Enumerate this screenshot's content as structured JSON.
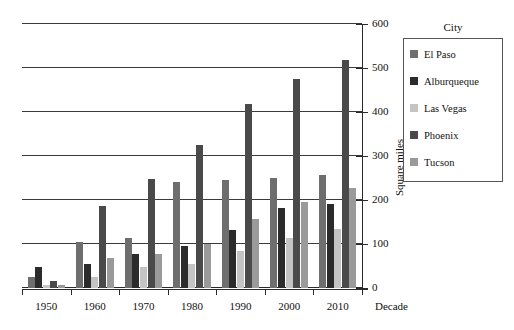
{
  "chart_data": {
    "type": "bar",
    "title": "",
    "xlabel": "Decade",
    "ylabel": "Square miles",
    "categories": [
      "1950",
      "1960",
      "1970",
      "1980",
      "1990",
      "2000",
      "2010"
    ],
    "ylim": [
      0,
      600
    ],
    "yticks": [
      0,
      100,
      200,
      300,
      400,
      500,
      600
    ],
    "grid": true,
    "legend_title": "City",
    "legend_position": "right",
    "series": [
      {
        "name": "El Paso",
        "color": "#6e6e6e",
        "values": [
          25,
          105,
          113,
          240,
          245,
          250,
          256
        ]
      },
      {
        "name": "Alburqueque",
        "color": "#2b2b2b",
        "values": [
          48,
          55,
          78,
          96,
          132,
          181,
          190
        ]
      },
      {
        "name": "Las Vegas",
        "color": "#c4c4c4",
        "values": [
          7,
          25,
          48,
          55,
          84,
          113,
          135
        ]
      },
      {
        "name": "Phoenix",
        "color": "#4a4a4a",
        "values": [
          17,
          187,
          248,
          324,
          419,
          475,
          518
        ]
      },
      {
        "name": "Tucson",
        "color": "#9a9a9a",
        "values": [
          6,
          68,
          78,
          100,
          156,
          195,
          227
        ]
      }
    ]
  }
}
